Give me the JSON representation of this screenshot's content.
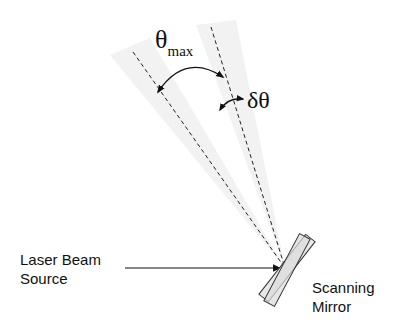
{
  "diagram": {
    "labels": {
      "theta_max_symbol": "θ",
      "theta_max_subscript": "max",
      "delta_theta": "δθ",
      "source_line1": "Laser Beam",
      "source_line2": "Source",
      "mirror_line1": "Scanning",
      "mirror_line2": "Mirror"
    },
    "colors": {
      "line": "#222222",
      "wedge": "#f1f1f1",
      "mirror_fill": "#e6e6e6",
      "mirror_stroke": "#333333"
    }
  }
}
